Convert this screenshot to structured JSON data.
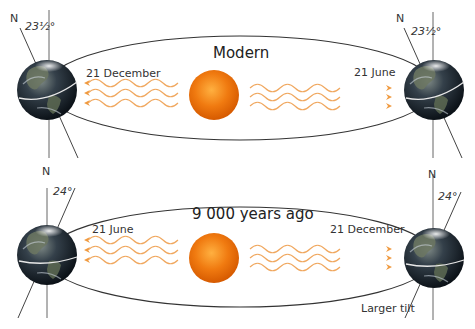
{
  "panels": [
    {
      "title": "Modern",
      "left_date": "21 December",
      "right_date": "21 June",
      "left_north": "N",
      "right_north": "N",
      "left_tilt": "23½°",
      "right_tilt": "23½°"
    },
    {
      "title": "9 000 years ago",
      "left_date": "21 June",
      "right_date": "21 December",
      "left_north": "N",
      "right_north": "N",
      "left_tilt": "24°",
      "right_tilt": "24°",
      "note": "Larger tilt"
    }
  ],
  "colors": {
    "orbit": "#333333",
    "axis": "#555555",
    "rays": "#f0a860",
    "sun_core": "#f07a10",
    "sun_edge": "#e06000",
    "earth_dark": "#1a2430",
    "earth_land": "#6a7a5a",
    "background": "#ffffff"
  }
}
